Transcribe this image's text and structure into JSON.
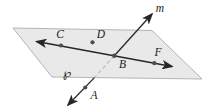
{
  "diagram": {
    "labels": {
      "line_m": "m",
      "point_C": "C",
      "point_D": "D",
      "point_B": "B",
      "point_F": "F",
      "point_A": "A",
      "plane": "℘"
    }
  },
  "colors": {
    "background": "#ffffff",
    "plane_fill": "#e9e9e9",
    "plane_edge": "#b5b5b5",
    "line": "#262626",
    "hidden_line": "#bdbdbd",
    "point_dot": "#4d4d4d",
    "label_text": "#1a1a1a"
  }
}
